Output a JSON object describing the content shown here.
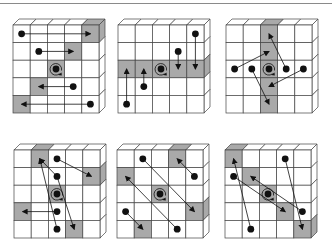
{
  "figure": {
    "grid_size": 5,
    "colors": {
      "cell_fill": "#ffffff",
      "shaded_fill": "#a9a9a9",
      "line": "#444444",
      "dot": "#111111"
    },
    "panels": [
      {
        "id": "panel-1",
        "origin": [
          13,
          25
        ],
        "shaded": [
          [
            4,
            0
          ],
          [
            3,
            1
          ],
          [
            2,
            2
          ],
          [
            1,
            3
          ],
          [
            0,
            4
          ]
        ],
        "top_shaded": [
          4
        ],
        "side_shaded": [
          0
        ],
        "dots": [
          [
            0,
            0
          ],
          [
            1,
            1
          ],
          [
            3,
            3
          ],
          [
            4,
            4
          ]
        ],
        "arrows": [
          [
            [
              0,
              0
            ],
            [
              4,
              0
            ]
          ],
          [
            [
              1,
              1
            ],
            [
              3,
              1
            ]
          ],
          [
            [
              3,
              3
            ],
            [
              1,
              3
            ]
          ],
          [
            [
              4,
              4
            ],
            [
              0,
              4
            ]
          ]
        ]
      },
      {
        "id": "panel-2",
        "origin": [
          118,
          25
        ],
        "shaded": [
          [
            0,
            2
          ],
          [
            1,
            2
          ],
          [
            2,
            2
          ],
          [
            3,
            2
          ],
          [
            4,
            2
          ]
        ],
        "top_shaded": [],
        "side_shaded": [
          2
        ],
        "dots": [
          [
            4,
            0
          ],
          [
            3,
            1
          ],
          [
            1,
            3
          ],
          [
            0,
            4
          ]
        ],
        "arrows": [
          [
            [
              4,
              0
            ],
            [
              4,
              2
            ]
          ],
          [
            [
              3,
              1
            ],
            [
              3,
              2
            ]
          ],
          [
            [
              1,
              3
            ],
            [
              1,
              2
            ]
          ],
          [
            [
              0,
              4
            ],
            [
              0,
              2
            ]
          ]
        ]
      },
      {
        "id": "panel-3",
        "origin": [
          226,
          25
        ],
        "shaded": [
          [
            2,
            0
          ],
          [
            2,
            1
          ],
          [
            2,
            2
          ],
          [
            2,
            3
          ],
          [
            2,
            4
          ]
        ],
        "top_shaded": [
          2
        ],
        "side_shaded": [],
        "dots": [
          [
            0,
            2
          ],
          [
            1,
            2
          ],
          [
            3,
            2
          ],
          [
            4,
            2
          ]
        ],
        "arrows": [
          [
            [
              0,
              2
            ],
            [
              2,
              1
            ]
          ],
          [
            [
              1,
              2
            ],
            [
              2,
              4
            ]
          ],
          [
            [
              3,
              2
            ],
            [
              2,
              0
            ]
          ],
          [
            [
              4,
              2
            ],
            [
              2,
              3
            ]
          ]
        ]
      },
      {
        "id": "panel-4",
        "origin": [
          14,
          150
        ],
        "shaded": [
          [
            1,
            0
          ],
          [
            4,
            1
          ],
          [
            2,
            2
          ],
          [
            0,
            3
          ],
          [
            3,
            4
          ]
        ],
        "top_shaded": [
          1
        ],
        "side_shaded": [
          1
        ],
        "dots": [
          [
            2,
            0
          ],
          [
            2,
            1
          ],
          [
            2,
            3
          ],
          [
            2,
            4
          ]
        ],
        "arrows": [
          [
            [
              2,
              0
            ],
            [
              4,
              1
            ]
          ],
          [
            [
              2,
              1
            ],
            [
              1,
              0
            ]
          ],
          [
            [
              2,
              3
            ],
            [
              0,
              3
            ]
          ],
          [
            [
              2,
              4
            ],
            [
              1,
              0
            ]
          ],
          [
            [
              2,
              1
            ],
            [
              3,
              4
            ]
          ]
        ]
      },
      {
        "id": "panel-5",
        "origin": [
          117,
          150
        ],
        "shaded": [
          [
            3,
            0
          ],
          [
            0,
            1
          ],
          [
            2,
            2
          ],
          [
            4,
            3
          ],
          [
            1,
            4
          ]
        ],
        "top_shaded": [
          3
        ],
        "side_shaded": [
          3
        ],
        "dots": [
          [
            1,
            0
          ],
          [
            4,
            1
          ],
          [
            0,
            3
          ],
          [
            3,
            4
          ]
        ],
        "arrows": [
          [
            [
              1,
              0
            ],
            [
              4,
              3
            ]
          ],
          [
            [
              4,
              1
            ],
            [
              3,
              0
            ]
          ],
          [
            [
              0,
              3
            ],
            [
              1,
              4
            ]
          ],
          [
            [
              3,
              4
            ],
            [
              0,
              1
            ]
          ]
        ]
      },
      {
        "id": "panel-6",
        "origin": [
          225,
          150
        ],
        "shaded": [
          [
            0,
            0
          ],
          [
            1,
            1
          ],
          [
            2,
            2
          ],
          [
            3,
            3
          ],
          [
            4,
            4
          ]
        ],
        "top_shaded": [
          0
        ],
        "side_shaded": [
          4
        ],
        "dots": [
          [
            3,
            0
          ],
          [
            0,
            1
          ],
          [
            4,
            3
          ],
          [
            1,
            4
          ]
        ],
        "arrows": [
          [
            [
              3,
              0
            ],
            [
              4,
              4
            ]
          ],
          [
            [
              0,
              1
            ],
            [
              3,
              3
            ]
          ],
          [
            [
              4,
              3
            ],
            [
              1,
              1
            ]
          ],
          [
            [
              1,
              4
            ],
            [
              0,
              0
            ]
          ]
        ]
      }
    ]
  }
}
